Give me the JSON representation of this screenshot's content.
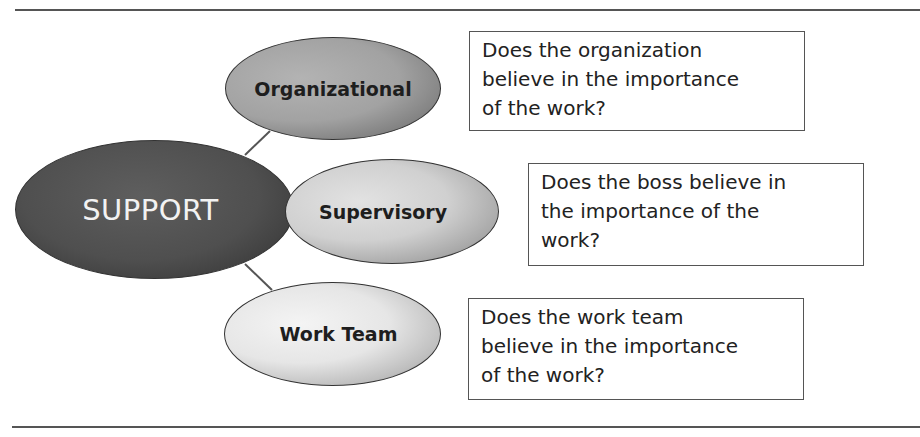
{
  "diagram": {
    "central_node": {
      "label": "SUPPORT",
      "fill": "#4f4f4f",
      "text_color": "#f2f2f2"
    },
    "branches": [
      {
        "label": "Organizational",
        "fill": "#a2a2a2",
        "question_lines": [
          "Does the organization",
          "believe in the importance",
          "of the work?"
        ]
      },
      {
        "label": "Supervisory",
        "fill": "#d0d0d0",
        "question_lines": [
          "Does the boss believe in",
          "the importance of the",
          "work?"
        ]
      },
      {
        "label": "Work Team",
        "fill": "#e6e6e6",
        "question_lines": [
          "Does the work team",
          "believe in the importance",
          "of the work?"
        ]
      }
    ],
    "connector_color": "#555555",
    "rule_color": "#555555"
  }
}
